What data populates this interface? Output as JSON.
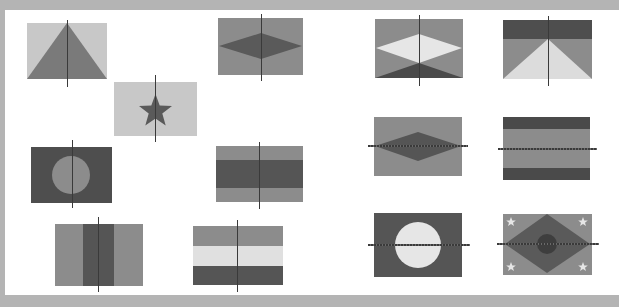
{
  "worksheet": {
    "title_visible": false,
    "colors": {
      "frame": "#b4b4b4",
      "background": "#ffffff",
      "light": "#c8c8c8",
      "mid": "#8c8c8c",
      "dark": "#5a5a5a",
      "darker": "#4a4a4a",
      "white_shape": "#e6e6e6",
      "axis": "#3a3a3a"
    },
    "flags": [
      {
        "id": 1,
        "design": "triangle",
        "axis": "vertical"
      },
      {
        "id": 2,
        "design": "star",
        "axis": "vertical"
      },
      {
        "id": 3,
        "design": "diamond",
        "axis": "vertical"
      },
      {
        "id": 4,
        "design": "circle",
        "axis": "vertical"
      },
      {
        "id": 5,
        "design": "horizontal-bands",
        "axis": "vertical"
      },
      {
        "id": 6,
        "design": "vertical-bands",
        "axis": "vertical"
      },
      {
        "id": 7,
        "design": "horizontal-tricolor",
        "axis": "vertical"
      },
      {
        "id": 8,
        "design": "light-diamond-over-dark-base",
        "axis": "vertical"
      },
      {
        "id": 9,
        "design": "triangle-under-top-band",
        "axis": "vertical"
      },
      {
        "id": 10,
        "design": "diamond",
        "axis": "horizontal"
      },
      {
        "id": 11,
        "design": "horizontal-bands",
        "axis": "horizontal"
      },
      {
        "id": 12,
        "design": "circle",
        "axis": "horizontal"
      },
      {
        "id": 13,
        "design": "diamond-circle-corner-stars",
        "axis": "horizontal"
      }
    ]
  }
}
